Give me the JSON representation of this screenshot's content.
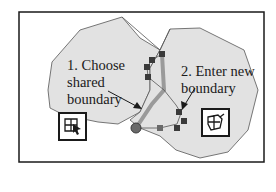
{
  "figure": {
    "colors": {
      "frame": "#1a1a1a",
      "polygon_fill": "#e2e2e2",
      "polygon_stroke": "#555555",
      "shared_boundary": "#9a9a9a",
      "vertex_marker": "#3a3a3a",
      "background": "#ffffff"
    },
    "labels": {
      "step1": "1. Choose\nshared\nboundary",
      "step2": "2. Enter new\nboundary"
    },
    "icons": {
      "left_tool": "select-shared-boundary-icon",
      "right_tool": "edit-boundary-icon"
    }
  }
}
